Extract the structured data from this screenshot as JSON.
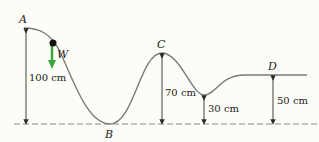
{
  "diagram": {
    "points": {
      "A": "A",
      "B": "B",
      "C": "C",
      "D": "D",
      "W": "W"
    },
    "heights": {
      "A": "100 cm",
      "C": "70 cm",
      "valley": "30 cm",
      "D": "50 cm"
    },
    "colors": {
      "track": "#7a7a7a",
      "arrow": "#2a2a2a",
      "weight_arrow": "#3aa53a",
      "ball": "#111111",
      "baseline": "#888888"
    }
  }
}
